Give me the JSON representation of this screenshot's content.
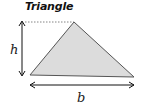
{
  "title": "Triangle",
  "labels": {
    "height": "h",
    "base": "b"
  },
  "colors": {
    "fill": "#dcdcdc",
    "stroke": "#555555",
    "arrow": "#111111",
    "dash": "#666666"
  },
  "shape": {
    "type": "triangle",
    "vertices": [
      [
        30,
        75
      ],
      [
        74,
        22
      ],
      [
        134,
        77
      ]
    ]
  }
}
